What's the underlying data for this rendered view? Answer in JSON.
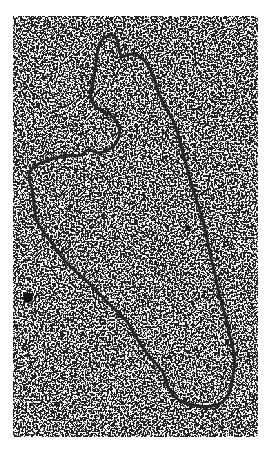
{
  "image": {
    "subject": "electron micrograph of a circular DNA molecule",
    "background_color": "#ffffff",
    "stain_color": "#1a1a1a",
    "strand_color": "#262626"
  }
}
